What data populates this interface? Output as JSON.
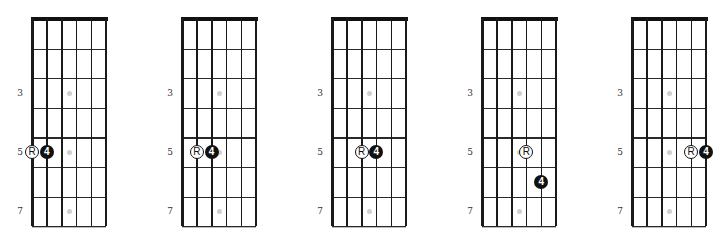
{
  "fretboard": {
    "num_strings": 6,
    "num_frets": 7,
    "fret_labels": [
      {
        "fret": 3,
        "label": "3"
      },
      {
        "fret": 5,
        "label": "5"
      },
      {
        "fret": 7,
        "label": "7"
      }
    ],
    "inlay_frets": [
      3,
      5,
      7
    ],
    "colors": {
      "line": "#1a1a1a",
      "inlay": "#cfcfcf",
      "root_fill": "#ffffff",
      "interval_fill": "#111111"
    }
  },
  "diagrams": [
    {
      "id": 1,
      "notes": [
        {
          "string": 1,
          "fret": 5,
          "type": "root",
          "label": "R"
        },
        {
          "string": 2,
          "fret": 5,
          "type": "interval",
          "label": "4"
        }
      ]
    },
    {
      "id": 2,
      "notes": [
        {
          "string": 2,
          "fret": 5,
          "type": "root",
          "label": "R"
        },
        {
          "string": 3,
          "fret": 5,
          "type": "interval",
          "label": "4"
        }
      ]
    },
    {
      "id": 3,
      "notes": [
        {
          "string": 3,
          "fret": 5,
          "type": "root",
          "label": "R"
        },
        {
          "string": 4,
          "fret": 5,
          "type": "interval",
          "label": "4"
        }
      ]
    },
    {
      "id": 4,
      "notes": [
        {
          "string": 4,
          "fret": 5,
          "type": "root",
          "label": "R"
        },
        {
          "string": 5,
          "fret": 6,
          "type": "interval",
          "label": "4"
        }
      ]
    },
    {
      "id": 5,
      "notes": [
        {
          "string": 5,
          "fret": 5,
          "type": "root",
          "label": "R"
        },
        {
          "string": 6,
          "fret": 5,
          "type": "interval",
          "label": "4"
        }
      ]
    }
  ]
}
